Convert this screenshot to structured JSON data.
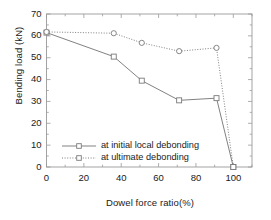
{
  "figure": {
    "background": "#ffffff",
    "frame_color": "#9a9a9a",
    "series_color": "#7a7a7a"
  },
  "chart_data": {
    "type": "line",
    "title": "",
    "xlabel": "Dowel force ratio(%)",
    "ylabel": "Bending load (kN)",
    "xlim": [
      0,
      110
    ],
    "ylim": [
      0,
      70
    ],
    "xticks": [
      0,
      20,
      40,
      60,
      80,
      100
    ],
    "yticks": [
      0,
      10,
      20,
      30,
      40,
      50,
      60,
      70
    ],
    "xtick_labels": [
      "0",
      "20",
      "40",
      "60",
      "80",
      "100"
    ],
    "ytick_labels": [
      "0",
      "10",
      "20",
      "30",
      "40",
      "50",
      "60",
      "70"
    ],
    "x_minor_step": 10,
    "y_minor_step": 5,
    "grid": false,
    "legend_position": "lower-left-inside",
    "marker": "open-square",
    "x": [
      0,
      36,
      51,
      71,
      91,
      100
    ],
    "series": [
      {
        "name": "at initial local debonding",
        "linestyle": "solid",
        "values": [
          61.5,
          50.5,
          39.5,
          30.5,
          31.5,
          0
        ]
      },
      {
        "name": "at ultimate debonding",
        "linestyle": "dotted",
        "values": [
          61.8,
          61.2,
          56.8,
          53.0,
          54.5,
          0
        ]
      }
    ]
  },
  "legend": {
    "items": [
      {
        "label": "at initial local debonding",
        "style": "solid"
      },
      {
        "label": "at ultimate debonding",
        "style": "dotted"
      }
    ]
  }
}
